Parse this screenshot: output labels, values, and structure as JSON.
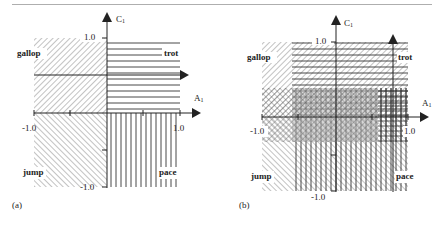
{
  "figure": {
    "panels": [
      {
        "caption": "(a)",
        "axis_y_label": "C",
        "axis_y_sub": "1",
        "axis_x_label": "A",
        "axis_x_sub": "1",
        "tick_y_top": "1.0",
        "tick_y_bottom": "-1.0",
        "tick_x_left": "-1.0",
        "tick_x_right": "1.0",
        "regions": [
          "gallop",
          "trot",
          "jump",
          "pace"
        ]
      },
      {
        "caption": "(b)",
        "axis_y_label": "C",
        "axis_y_sub": "1",
        "axis_x_label": "A",
        "axis_x_sub": "1",
        "tick_y_top": "1.0",
        "tick_y_bottom": "-1.0",
        "tick_x_left": "-1.0",
        "tick_x_right": "1.0",
        "regions": [
          "gallop",
          "trot",
          "jump",
          "pace"
        ]
      }
    ],
    "colors": {
      "ink": "#222222",
      "hatch": "#555555",
      "shade": "#bdbdbd"
    }
  }
}
